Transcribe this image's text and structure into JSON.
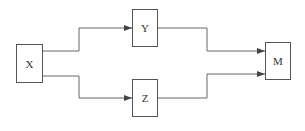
{
  "diagram": {
    "nodes": [
      {
        "id": "X",
        "label": "X"
      },
      {
        "id": "Y",
        "label": "Y"
      },
      {
        "id": "Z",
        "label": "Z"
      },
      {
        "id": "M",
        "label": "M"
      }
    ],
    "edges": [
      {
        "from": "X",
        "to": "Y"
      },
      {
        "from": "X",
        "to": "Z"
      },
      {
        "from": "Y",
        "to": "M"
      },
      {
        "from": "Z",
        "to": "M"
      }
    ],
    "colors": {
      "line": "#555555",
      "background": "#ffffff",
      "text": "#333333"
    }
  }
}
